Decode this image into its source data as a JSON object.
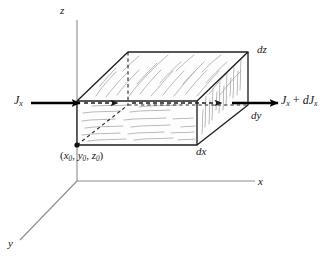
{
  "figure": {
    "type": "3d-volume-element-diagram",
    "axes": {
      "z_label": "z",
      "x_label": "x",
      "y_label": "y",
      "color": "#8d8d8d"
    },
    "labels": {
      "current_in": "J",
      "current_in_sub": "x",
      "current_out_first": "J",
      "current_out_first_sub": "x",
      "current_out_operator": " + ",
      "current_out_second": "dJ",
      "current_out_second_sub": "x",
      "depth_dz": "dz",
      "depth_dy": "dy",
      "depth_dx": "dx",
      "origin_point": "(x0, y0, z0)",
      "origin_open": "(",
      "origin_x": "x",
      "origin_x_sub": "0",
      "origin_sep1": ", ",
      "origin_y": "y",
      "origin_y_sub": "0",
      "origin_sep2": ", ",
      "origin_z": "z",
      "origin_z_sub": "0",
      "origin_close": ")"
    },
    "colors": {
      "ink": "#161616",
      "axis": "#8d8d8d",
      "hatch": "#a0a0a0",
      "edge": "#2b2b2b",
      "arrow": "#000000"
    },
    "geometry": {
      "box_front_top_left": [
        77,
        101
      ],
      "box_front_top_right": [
        197,
        101
      ],
      "box_front_bottom_left": [
        77,
        145
      ],
      "box_front_bottom_right": [
        197,
        145
      ],
      "box_back_top_left": [
        128,
        52
      ],
      "box_back_top_right": [
        248,
        52
      ],
      "box_back_bottom_right": [
        248,
        105
      ],
      "axis_origin": [
        77,
        181
      ]
    }
  }
}
